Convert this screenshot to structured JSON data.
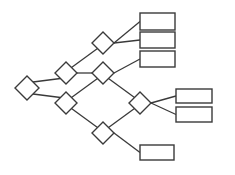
{
  "diagram": {
    "type": "tree-flowchart",
    "stroke_color": "#3a3a3a",
    "fill_color": "#ffffff",
    "background": "#ffffff",
    "decisions": [
      {
        "id": "d1",
        "cx": 27,
        "cy": 88,
        "r": 12
      },
      {
        "id": "d2",
        "cx": 66,
        "cy": 73,
        "r": 11
      },
      {
        "id": "d3",
        "cx": 66,
        "cy": 103,
        "r": 11
      },
      {
        "id": "d4",
        "cx": 103,
        "cy": 43,
        "r": 11
      },
      {
        "id": "d5",
        "cx": 103,
        "cy": 73,
        "r": 11
      },
      {
        "id": "d6",
        "cx": 140,
        "cy": 103,
        "r": 11
      },
      {
        "id": "d7",
        "cx": 103,
        "cy": 133,
        "r": 11
      }
    ],
    "boxes": [
      {
        "id": "b1",
        "x": 140,
        "y": 13,
        "w": 35,
        "h": 17
      },
      {
        "id": "b2",
        "x": 140,
        "y": 32,
        "w": 35,
        "h": 16
      },
      {
        "id": "b3",
        "x": 140,
        "y": 51,
        "w": 35,
        "h": 16
      },
      {
        "id": "b4",
        "x": 176,
        "y": 89,
        "w": 36,
        "h": 14
      },
      {
        "id": "b5",
        "x": 176,
        "y": 107,
        "w": 36,
        "h": 15
      },
      {
        "id": "b6",
        "x": 140,
        "y": 145,
        "w": 34,
        "h": 15
      }
    ],
    "edges": [
      {
        "from": "d1",
        "to": "d2"
      },
      {
        "from": "d1",
        "to": "d3"
      },
      {
        "from": "d2",
        "to": "d4"
      },
      {
        "from": "d2",
        "to": "d5"
      },
      {
        "from": "d3",
        "to": "d5"
      },
      {
        "from": "d3",
        "to": "d7"
      },
      {
        "from": "d4",
        "to": "b1"
      },
      {
        "from": "d4",
        "to": "b2"
      },
      {
        "from": "d5",
        "to": "b3"
      },
      {
        "from": "d5",
        "to": "d6"
      },
      {
        "from": "d7",
        "to": "d6"
      },
      {
        "from": "d6",
        "to": "b4"
      },
      {
        "from": "d6",
        "to": "b5"
      },
      {
        "from": "d7",
        "to": "b6"
      }
    ]
  }
}
